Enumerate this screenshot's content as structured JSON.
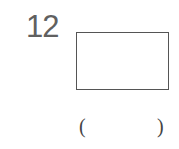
{
  "question": {
    "number": "12",
    "figure": "rectangle",
    "answer_open": "(",
    "answer_close": ")",
    "answer_value": ""
  }
}
